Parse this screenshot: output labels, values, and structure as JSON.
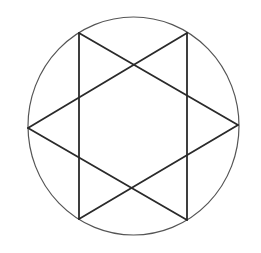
{
  "figure": {
    "stroke_color": "#2a2a2a",
    "circle_color": "#555555",
    "circle": {
      "cx": 133.5,
      "cy": 126,
      "rx": 105.5,
      "ry": 109
    },
    "vertices": {
      "top_left": [
        79,
        33
      ],
      "top_right": [
        187,
        33
      ],
      "right": [
        238,
        125
      ],
      "bottom_right": [
        187,
        220
      ],
      "bottom_left": [
        79,
        219
      ],
      "left": [
        28,
        128
      ]
    },
    "segments": [
      {
        "name": "top-left-to-right",
        "from": [
          79,
          33
        ],
        "to": [
          238,
          125
        ]
      },
      {
        "name": "right-to-bottom-left",
        "from": [
          238,
          125
        ],
        "to": [
          79,
          219
        ]
      },
      {
        "name": "top-right-to-left",
        "from": [
          187,
          33
        ],
        "to": [
          28,
          128
        ]
      },
      {
        "name": "left-to-bottom-right",
        "from": [
          28,
          128
        ],
        "to": [
          187,
          220
        ]
      },
      {
        "name": "left-vertical",
        "from": [
          79,
          33
        ],
        "to": [
          79,
          219
        ]
      },
      {
        "name": "right-vertical",
        "from": [
          187,
          33
        ],
        "to": [
          187,
          220
        ]
      }
    ]
  }
}
